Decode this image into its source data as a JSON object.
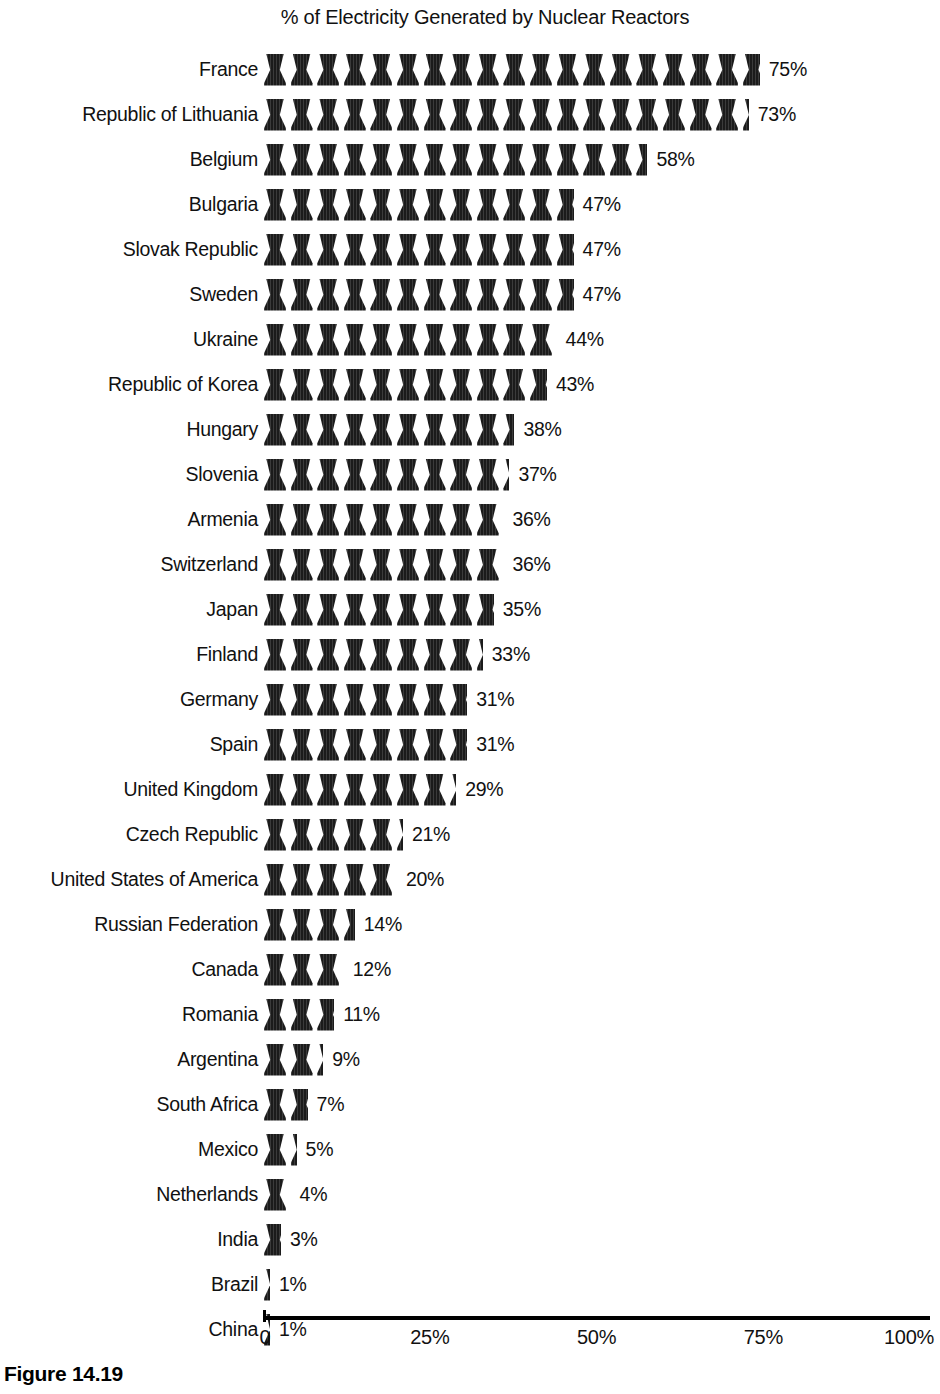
{
  "chart_data": {
    "type": "bar",
    "subtype": "pictogram-isotype",
    "title": "% of Electricity Generated by Nuclear Reactors",
    "xlabel": "",
    "ylabel": "",
    "xlim": [
      0,
      100
    ],
    "grid": false,
    "legend": null,
    "icon": "cooling-tower-icon",
    "icon_unit_percent": 4,
    "value_suffix": "%",
    "tick_labels": [
      "0",
      "25%",
      "50%",
      "75%",
      "100%"
    ],
    "tick_values": [
      0,
      25,
      50,
      75,
      100
    ],
    "categories": [
      "France",
      "Republic of Lithuania",
      "Belgium",
      "Bulgaria",
      "Slovak Republic",
      "Sweden",
      "Ukraine",
      "Republic of Korea",
      "Hungary",
      "Slovenia",
      "Armenia",
      "Switzerland",
      "Japan",
      "Finland",
      "Germany",
      "Spain",
      "United Kingdom",
      "Czech Republic",
      "United States of America",
      "Russian Federation",
      "Canada",
      "Romania",
      "Argentina",
      "South Africa",
      "Mexico",
      "Netherlands",
      "India",
      "Brazil",
      "China"
    ],
    "values": [
      75,
      73,
      58,
      47,
      47,
      47,
      44,
      43,
      38,
      37,
      36,
      36,
      35,
      33,
      31,
      31,
      29,
      21,
      20,
      14,
      12,
      11,
      9,
      7,
      5,
      4,
      3,
      1,
      1
    ],
    "value_labels": [
      "75%",
      "73%",
      "58%",
      "47%",
      "47%",
      "47%",
      "44%",
      "43%",
      "38%",
      "37%",
      "36%",
      "36%",
      "35%",
      "33%",
      "31%",
      "31%",
      "29%",
      "21%",
      "20%",
      "14%",
      "12%",
      "11%",
      "9%",
      "7%",
      "5%",
      "4%",
      "3%",
      "1%",
      "1%"
    ]
  },
  "caption": {
    "figure_label": "Figure 14.19"
  },
  "colors": {
    "icon": "#1b1b1b",
    "text": "#111111",
    "axis": "#000000",
    "background": "#ffffff"
  }
}
